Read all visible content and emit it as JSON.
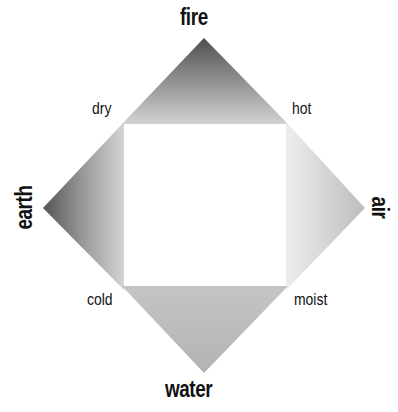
{
  "diagram": {
    "type": "four-elements-qualities-diamond",
    "elements": {
      "top": {
        "label": "fire"
      },
      "left": {
        "label": "earth"
      },
      "right": {
        "label": "air"
      },
      "bottom": {
        "label": "water"
      }
    },
    "qualities": {
      "top_left": {
        "label": "dry"
      },
      "top_right": {
        "label": "hot"
      },
      "bottom_left": {
        "label": "cold"
      },
      "bottom_right": {
        "label": "moist"
      }
    },
    "colors": {
      "background": "#ffffff",
      "text": "#111111",
      "fire_tip": "#4f4f4f",
      "fire_base": "#d2d2d2",
      "earth_tip": "#555555",
      "earth_base": "#d4d4d4",
      "air_tip": "#bdbdbd",
      "air_base": "#ececec",
      "water_tip": "#b3b3b3",
      "water_base": "#c4c4c4",
      "center": "#ffffff"
    }
  }
}
